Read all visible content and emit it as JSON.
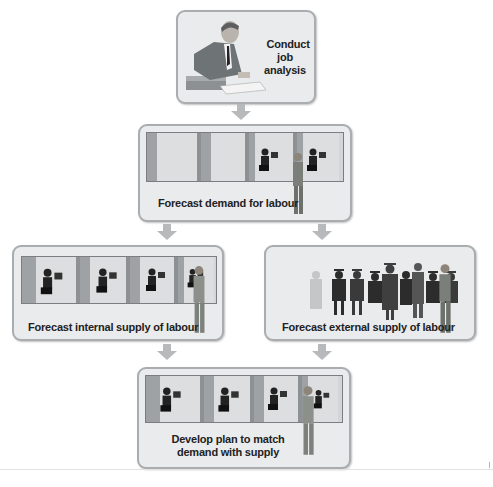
{
  "diagram": {
    "type": "flowchart",
    "nodes": [
      {
        "id": "job-analysis",
        "label_lines": [
          "Conduct",
          "job analysis"
        ],
        "illustration": "man writing at desk"
      },
      {
        "id": "demand",
        "label": "Forecast demand for labour",
        "illustration": "office cubicles with manager"
      },
      {
        "id": "internal-supply",
        "label": "Forecast internal supply of labour",
        "illustration": "staffed office cubicles with manager"
      },
      {
        "id": "external-supply",
        "label": "Forecast external supply of labour",
        "illustration": "graduates in gowns with manager"
      },
      {
        "id": "plan",
        "label_lines": [
          "Develop plan to match",
          "demand with supply"
        ],
        "illustration": "fully staffed cubicles with manager"
      }
    ],
    "edges": [
      {
        "from": "job-analysis",
        "to": "demand"
      },
      {
        "from": "demand",
        "to": "internal-supply"
      },
      {
        "from": "demand",
        "to": "external-supply"
      },
      {
        "from": "internal-supply",
        "to": "plan"
      },
      {
        "from": "external-supply",
        "to": "plan"
      }
    ],
    "colors": {
      "box_fill": "#e9ebec",
      "box_border": "#a9adb0",
      "arrow": "#b7b9bb",
      "text": "#222222"
    }
  }
}
